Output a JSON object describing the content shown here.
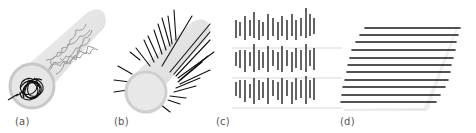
{
  "figure": {
    "panels": [
      {
        "id": "a",
        "label": "(a)",
        "description": "random coil polymer inside cylindrical tube"
      },
      {
        "id": "b",
        "label": "(b)",
        "description": "bottle-brush with radially extended side chains"
      },
      {
        "id": "c",
        "label": "(c)",
        "description": "layered smectic arrangement of rods"
      },
      {
        "id": "d",
        "label": "(d)",
        "description": "tilted stack of parallel aligned chains"
      }
    ]
  },
  "colors": {
    "background": "#ffffff",
    "cylinder": "#d9d9d9",
    "cylinder_end": "#c4c4c4",
    "strand": "#111111",
    "light_strand": "#9a9a9a",
    "guide_line": "#cfcfcf",
    "label": "#555555"
  }
}
